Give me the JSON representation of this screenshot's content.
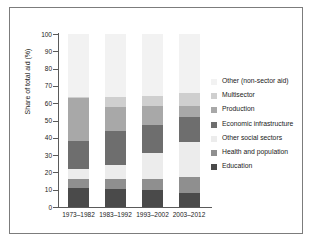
{
  "chart_data": {
    "type": "bar",
    "subtype": "stacked-bar-100",
    "title": "",
    "xlabel": "",
    "ylabel": "Share of total aid (%)",
    "ylim": [
      0,
      100
    ],
    "yticks": [
      0,
      10,
      20,
      30,
      40,
      50,
      60,
      70,
      80,
      90,
      100
    ],
    "grid": false,
    "legend_position": "right",
    "categories": [
      "1973–1982",
      "1983–1992",
      "1993–2002",
      "2003–2012"
    ],
    "series": [
      {
        "name": "Education",
        "color": "#4a4a4a",
        "values": [
          11.0,
          10.5,
          10.0,
          8.0
        ]
      },
      {
        "name": "Health and population",
        "color": "#8f8f8f",
        "values": [
          5.0,
          5.5,
          6.0,
          9.5
        ]
      },
      {
        "name": "Other social sectors",
        "color": "#ececec",
        "values": [
          6.0,
          8.5,
          15.0,
          20.0
        ]
      },
      {
        "name": "Economic infrastructure",
        "color": "#6e6e6e",
        "values": [
          16.0,
          19.5,
          16.5,
          14.5
        ]
      },
      {
        "name": "Production",
        "color": "#a8a8a8",
        "values": [
          25.0,
          14.0,
          11.0,
          6.5
        ]
      },
      {
        "name": "Multisector",
        "color": "#cfcfcf",
        "values": [
          0.5,
          5.5,
          5.5,
          7.5
        ]
      },
      {
        "name": "Other (non-sector aid)",
        "color": "#f2f2f2",
        "values": [
          36.5,
          36.5,
          36.0,
          34.0
        ]
      }
    ],
    "legend_entries": [
      "Other (non-sector aid)",
      "Multisector",
      "Production",
      "Economic infrastructure",
      "Other social sectors",
      "Health and population",
      "Education"
    ]
  },
  "axis": {
    "y_title": "Share of total aid (%)",
    "y_tick_labels": [
      "0",
      "10",
      "20",
      "30",
      "40",
      "50",
      "60",
      "70",
      "80",
      "90",
      "100"
    ],
    "x_tick_labels": [
      "1973–1982",
      "1983–1992",
      "1993–2002",
      "2003–2012"
    ]
  },
  "style": {
    "axis_color": "#5a5a5a",
    "frame_color": "#7c7c7c",
    "text_color": "#1a1a1a",
    "background": "#ffffff"
  }
}
